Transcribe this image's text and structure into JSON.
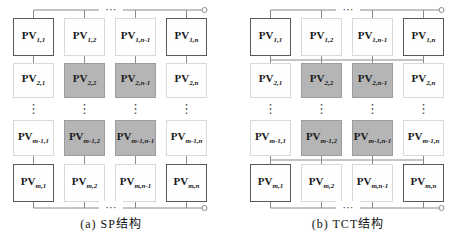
{
  "figure": {
    "background": "#ffffff",
    "symbols": {
      "h_ellipsis": "⋯",
      "v_ellipsis": "⋮"
    },
    "colors": {
      "wire": "#8a8a8a",
      "module_fill": "#fefefe",
      "module_border_light": "#d9d9d9",
      "module_border_dark": "#595959",
      "shaded_module_fill": "#b5b5b5",
      "shaded_module_border": "#9c9c9c",
      "label_text": "#1a1a1a"
    },
    "diagrams": [
      {
        "id": "sp",
        "caption": "(a) SP结构",
        "modules": [
          {
            "base": "PV",
            "sub": "1,1",
            "shaded": false,
            "emphasis": true
          },
          {
            "base": "PV",
            "sub": "1,2",
            "shaded": false,
            "emphasis": false
          },
          {
            "base": "PV",
            "sub": "1,n-1",
            "shaded": false,
            "emphasis": false
          },
          {
            "base": "PV",
            "sub": "1,n",
            "shaded": false,
            "emphasis": true
          },
          {
            "base": "PV",
            "sub": "2,1",
            "shaded": false,
            "emphasis": false
          },
          {
            "base": "PV",
            "sub": "2,2",
            "shaded": true,
            "emphasis": false
          },
          {
            "base": "PV",
            "sub": "2,n-1",
            "shaded": true,
            "emphasis": false
          },
          {
            "base": "PV",
            "sub": "2,n",
            "shaded": false,
            "emphasis": false
          },
          {
            "base": "PV",
            "sub": "m-1,1",
            "shaded": false,
            "emphasis": false
          },
          {
            "base": "PV",
            "sub": "m-1,2",
            "shaded": true,
            "emphasis": false
          },
          {
            "base": "PV",
            "sub": "m-1,n-1",
            "shaded": true,
            "emphasis": false
          },
          {
            "base": "PV",
            "sub": "m-1,n",
            "shaded": false,
            "emphasis": false
          },
          {
            "base": "PV",
            "sub": "m,1",
            "shaded": false,
            "emphasis": true
          },
          {
            "base": "PV",
            "sub": "m,2",
            "shaded": false,
            "emphasis": false
          },
          {
            "base": "PV",
            "sub": "m,n-1",
            "shaded": false,
            "emphasis": false
          },
          {
            "base": "PV",
            "sub": "m,n",
            "shaded": false,
            "emphasis": true
          }
        ]
      },
      {
        "id": "tct",
        "caption": "(b) TCT结构",
        "modules": [
          {
            "base": "PV",
            "sub": "1,1",
            "shaded": false,
            "emphasis": true
          },
          {
            "base": "PV",
            "sub": "1,2",
            "shaded": false,
            "emphasis": false
          },
          {
            "base": "PV",
            "sub": "1,n-1",
            "shaded": false,
            "emphasis": false
          },
          {
            "base": "PV",
            "sub": "1,n",
            "shaded": false,
            "emphasis": true
          },
          {
            "base": "PV",
            "sub": "2,1",
            "shaded": false,
            "emphasis": false
          },
          {
            "base": "PV",
            "sub": "2,2",
            "shaded": true,
            "emphasis": false
          },
          {
            "base": "PV",
            "sub": "2,n-1",
            "shaded": true,
            "emphasis": false
          },
          {
            "base": "PV",
            "sub": "2,n",
            "shaded": false,
            "emphasis": false
          },
          {
            "base": "PV",
            "sub": "m-1,1",
            "shaded": false,
            "emphasis": false
          },
          {
            "base": "PV",
            "sub": "m-1,2",
            "shaded": true,
            "emphasis": false
          },
          {
            "base": "PV",
            "sub": "m-1,n-1",
            "shaded": true,
            "emphasis": false
          },
          {
            "base": "PV",
            "sub": "m-1,n",
            "shaded": false,
            "emphasis": false
          },
          {
            "base": "PV",
            "sub": "m,1",
            "shaded": false,
            "emphasis": true
          },
          {
            "base": "PV",
            "sub": "m,2",
            "shaded": false,
            "emphasis": false
          },
          {
            "base": "PV",
            "sub": "m,n-1",
            "shaded": false,
            "emphasis": false
          },
          {
            "base": "PV",
            "sub": "m,n",
            "shaded": false,
            "emphasis": true
          }
        ]
      }
    ]
  }
}
